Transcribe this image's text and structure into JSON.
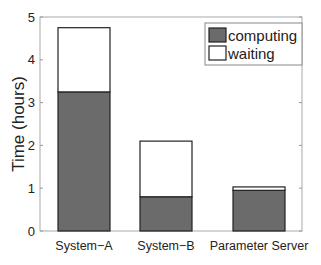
{
  "chart_data": {
    "type": "bar",
    "stacked": true,
    "title": "",
    "xlabel": "",
    "ylabel": "Time (hours)",
    "ylim": [
      0,
      5
    ],
    "yticks": [
      0,
      1,
      2,
      3,
      4,
      5
    ],
    "grid": false,
    "legend_position": "upper right",
    "categories": [
      "System−A",
      "System−B",
      "Parameter Server"
    ],
    "series": [
      {
        "name": "computing",
        "color": "#6b6b6b",
        "values": [
          3.25,
          0.8,
          0.95
        ]
      },
      {
        "name": "waiting",
        "color": "#ffffff",
        "values": [
          1.5,
          1.3,
          0.08
        ]
      }
    ],
    "totals": [
      4.75,
      2.1,
      1.03
    ]
  }
}
